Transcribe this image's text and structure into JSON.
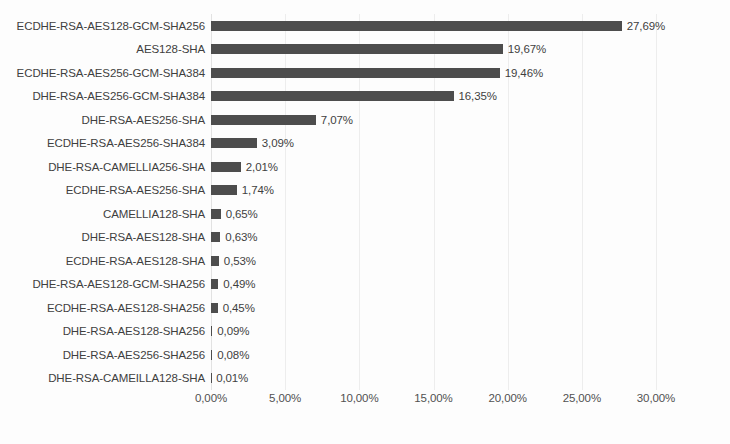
{
  "chart_data": {
    "type": "bar",
    "orientation": "horizontal",
    "title": "",
    "xlabel": "",
    "ylabel": "",
    "xlim": [
      0,
      30
    ],
    "grid": true,
    "legend": "none",
    "value_suffix": "%",
    "decimal_separator": ",",
    "bar_color": "#4d4d4d",
    "gridline_color": "#ededed",
    "text_color": "#3f3f3f",
    "background_color": "#fdfdfd",
    "xticks": [
      "0,00%",
      "5,00%",
      "10,00%",
      "15,00%",
      "20,00%",
      "25,00%",
      "30,00%"
    ],
    "xtick_values": [
      0,
      5,
      10,
      15,
      20,
      25,
      30
    ],
    "categories": [
      "ECDHE-RSA-AES128-GCM-SHA256",
      "AES128-SHA",
      "ECDHE-RSA-AES256-GCM-SHA384",
      "DHE-RSA-AES256-GCM-SHA384",
      "DHE-RSA-AES256-SHA",
      "ECDHE-RSA-AES256-SHA384",
      "DHE-RSA-CAMELLIA256-SHA",
      "ECDHE-RSA-AES256-SHA",
      "CAMELLIA128-SHA",
      "DHE-RSA-AES128-SHA",
      "ECDHE-RSA-AES128-SHA",
      "DHE-RSA-AES128-GCM-SHA256",
      "ECDHE-RSA-AES128-SHA256",
      "DHE-RSA-AES128-SHA256",
      "DHE-RSA-AES256-SHA256",
      "DHE-RSA-CAMEILLA128-SHA"
    ],
    "values": [
      27.69,
      19.67,
      19.46,
      16.35,
      7.07,
      3.09,
      2.01,
      1.74,
      0.65,
      0.63,
      0.53,
      0.49,
      0.45,
      0.09,
      0.08,
      0.01
    ],
    "value_labels": [
      "27,69%",
      "19,67%",
      "19,46%",
      "16,35%",
      "7,07%",
      "3,09%",
      "2,01%",
      "1,74%",
      "0,65%",
      "0,63%",
      "0,53%",
      "0,49%",
      "0,45%",
      "0,09%",
      "0,08%",
      "0,01%"
    ]
  }
}
